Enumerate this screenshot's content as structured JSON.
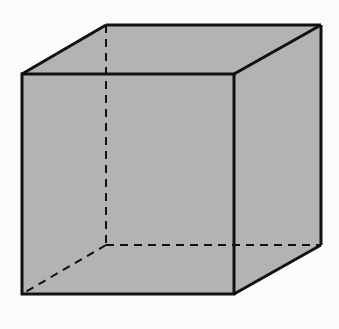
{
  "diagram": {
    "type": "cube",
    "fill_color": "#b3b3b3",
    "edge_color": "#111111",
    "background": "#fbfbfb",
    "vertices": {
      "front_top_left": [
        22,
        74
      ],
      "front_top_right": [
        234,
        74
      ],
      "front_bottom_right": [
        234,
        294
      ],
      "front_bottom_left": [
        22,
        294
      ],
      "back_top_left": [
        106,
        25
      ],
      "back_top_right": [
        321,
        25
      ],
      "back_bottom_right": [
        321,
        245
      ],
      "back_bottom_left": [
        106,
        245
      ]
    },
    "visible_edges": 9,
    "hidden_edges": 3
  }
}
